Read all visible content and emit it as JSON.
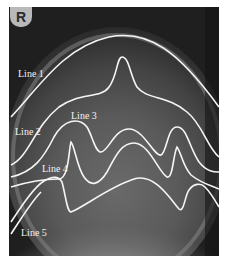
{
  "figure": {
    "orientation_marker": "R",
    "line_color": "#f5f5f5",
    "background_color": "#1e1e1e",
    "lines": [
      {
        "id": 1,
        "label": "Line 1"
      },
      {
        "id": 2,
        "label": "Line 2"
      },
      {
        "id": 3,
        "label": "Line 3"
      },
      {
        "id": 4,
        "label": "Line 4"
      },
      {
        "id": 5,
        "label": "Line 5"
      }
    ]
  }
}
